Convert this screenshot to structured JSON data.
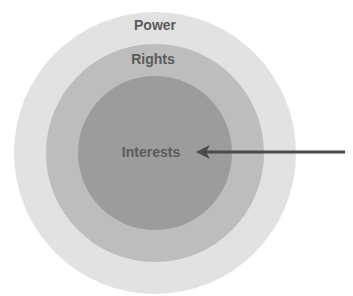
{
  "diagram": {
    "type": "concentric-circles",
    "center": {
      "x": 155,
      "y": 153
    },
    "rings": [
      {
        "id": "power",
        "label": "Power",
        "radius": 141,
        "fill": "#e2e2e2",
        "label_x": 155,
        "label_y": 17
      },
      {
        "id": "rights",
        "label": "Rights",
        "radius": 109,
        "fill": "#bdbdbd",
        "label_x": 153,
        "label_y": 52
      },
      {
        "id": "interests",
        "label": "Interests",
        "radius": 77,
        "fill": "#9c9c9c",
        "label_x": 151,
        "label_y": 144
      }
    ],
    "arrow": {
      "from": {
        "x": 345,
        "y": 152
      },
      "to": {
        "x": 197,
        "y": 152
      },
      "color": "#4a4a4a",
      "points_to": "Interests"
    }
  }
}
